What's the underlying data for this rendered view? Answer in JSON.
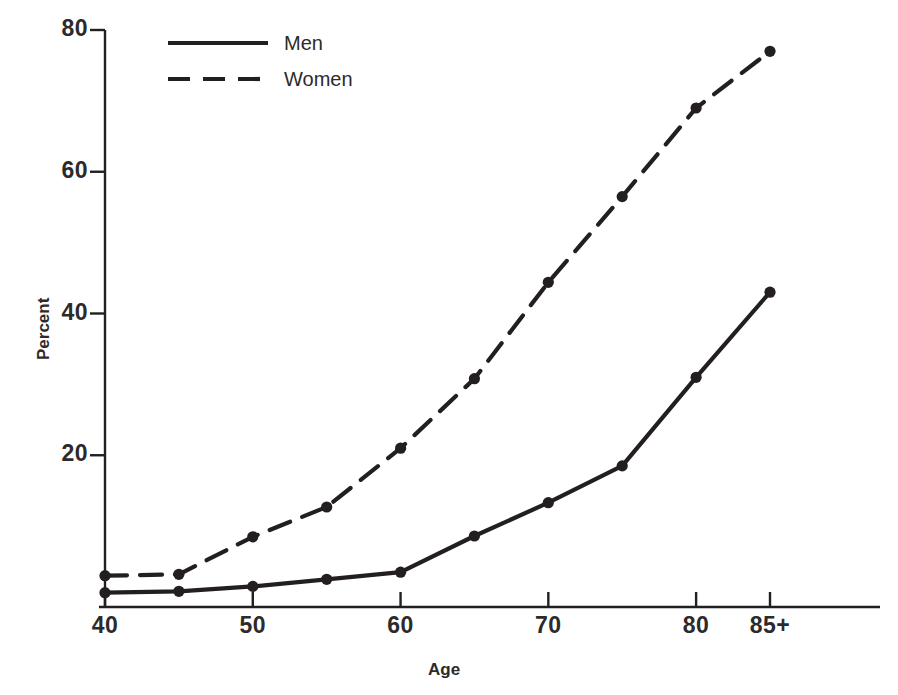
{
  "chart_data": {
    "type": "line",
    "title": "",
    "xlabel": "Age",
    "ylabel": "Percent",
    "xlim": [
      40,
      87
    ],
    "ylim": [
      0,
      80
    ],
    "grid": false,
    "legend_position": "top-left",
    "x": [
      40,
      45,
      50,
      55,
      60,
      65,
      70,
      75,
      80,
      85
    ],
    "categories": [
      "40",
      "45",
      "50",
      "55",
      "60",
      "65",
      "70",
      "75",
      "80",
      "85+"
    ],
    "series": [
      {
        "name": "Men",
        "style": "solid",
        "color": "#231f20",
        "values": [
          0.6,
          0.8,
          1.5,
          2.5,
          3.5,
          8.6,
          13.3,
          18.5,
          31.0,
          43.0
        ]
      },
      {
        "name": "Women",
        "style": "dashed",
        "color": "#231f20",
        "values": [
          3.0,
          3.2,
          8.5,
          12.7,
          21.0,
          30.8,
          44.4,
          56.5,
          69.0,
          77.0
        ]
      }
    ],
    "xticks": [
      {
        "value": 40,
        "label": "40"
      },
      {
        "value": 50,
        "label": "50"
      },
      {
        "value": 60,
        "label": "60"
      },
      {
        "value": 70,
        "label": "70"
      },
      {
        "value": 80,
        "label": "80"
      },
      {
        "value": 85,
        "label": "85+"
      }
    ],
    "yticks": [
      {
        "value": 20,
        "label": "20"
      },
      {
        "value": 40,
        "label": "40"
      },
      {
        "value": 60,
        "label": "60"
      },
      {
        "value": 80,
        "label": "80"
      }
    ]
  },
  "axes": {
    "y_title": "Percent",
    "x_title": "Age"
  },
  "legend": {
    "entries": [
      {
        "label": "Men",
        "style": "solid"
      },
      {
        "label": "Women",
        "style": "dashed"
      }
    ]
  },
  "ticks": {
    "y": [
      "80",
      "60",
      "40",
      "20"
    ],
    "x": [
      "40",
      "50",
      "60",
      "70",
      "80",
      "85+"
    ]
  }
}
